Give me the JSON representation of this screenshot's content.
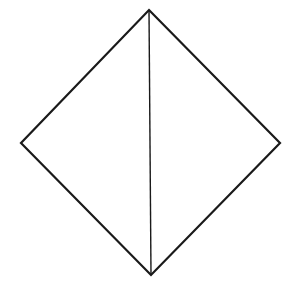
{
  "diagram": {
    "width": 301,
    "height": 297,
    "background": "#ffffff",
    "stroke": "#1a1a1a",
    "outline_width": 2.2,
    "diagonal_width": 1.4,
    "vertices": {
      "top": [
        149,
        10
      ],
      "right": [
        280,
        143
      ],
      "bottom": [
        151,
        275
      ],
      "left": [
        21,
        143
      ]
    },
    "outline_points": "149,10 280,143 151,275 21,143",
    "diagonal": {
      "x1": 149,
      "y1": 10,
      "x2": 151,
      "y2": 275
    }
  }
}
